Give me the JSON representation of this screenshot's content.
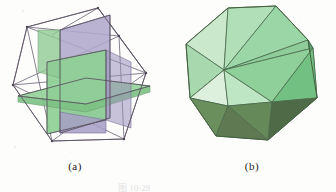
{
  "figure": {
    "caption": "图 10-28",
    "panels": [
      {
        "id": "a",
        "label": "(a)",
        "name": "three-golden-rectangles-in-octahedron",
        "description": "Three mutually perpendicular golden rectangles inscribed in an octahedral wireframe",
        "colors": {
          "green_fill": "#96d49a",
          "green_fill_dark": "#7cc184",
          "purple_fill": "#b0a8cc",
          "purple_fill_dark": "#9a90bb",
          "wire_stroke": "#6b6274",
          "edge_stroke": "#5a5160"
        }
      },
      {
        "id": "b",
        "label": "(b)",
        "name": "icosahedron",
        "description": "Shaded regular icosahedron",
        "colors": {
          "face_lightest": "#d3ecd5",
          "face_light": "#b5e0bb",
          "face_mid": "#8fd09a",
          "face_medium": "#72c082",
          "face_dark": "#5a9e69",
          "face_darkest": "#5f7a52",
          "face_shadow": "#4e6a46",
          "edge_stroke": "#4a6a4c"
        }
      }
    ]
  },
  "background_color": "#fdfdfc"
}
